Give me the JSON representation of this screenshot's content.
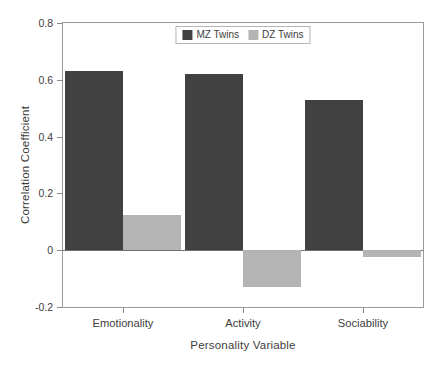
{
  "chart_data": {
    "type": "bar",
    "title": "",
    "subtitle": "",
    "xlabel": "Personality Variable",
    "ylabel": "Correlation Coefficient",
    "categories": [
      "Emotionality",
      "Activity",
      "Sociability"
    ],
    "series": [
      {
        "name": "MZ Twins",
        "color": "#414141",
        "values": [
          0.63,
          0.62,
          0.53
        ]
      },
      {
        "name": "DZ Twins",
        "color": "#b4b4b4",
        "values": [
          0.125,
          -0.13,
          -0.025
        ]
      }
    ],
    "ylim": [
      -0.2,
      0.8
    ],
    "yticks": [
      0.8,
      0.6,
      0.4,
      0.2,
      0,
      -0.2
    ],
    "ytick_labels": [
      "0.8",
      "0.6",
      "0.4",
      "0.2",
      "0",
      "-0.2"
    ],
    "grid": false,
    "legend_position": "top-center-inside",
    "zero_line": 0
  },
  "axes": {
    "y_title": "Correlation Coefficient",
    "x_title": "Personality Variable"
  },
  "legend": {
    "entries": [
      {
        "label": "MZ Twins",
        "swatch": "mz"
      },
      {
        "label": "DZ Twins",
        "swatch": "dz"
      }
    ]
  }
}
